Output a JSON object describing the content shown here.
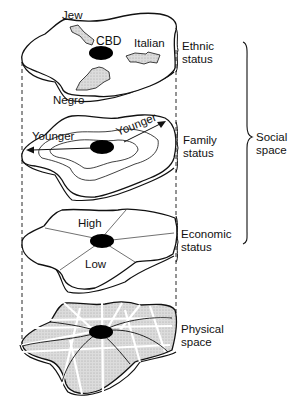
{
  "layers": [
    {
      "id": "ethnic",
      "label_lines": [
        "Ethnic",
        "status"
      ],
      "inner_labels": {
        "jew": "Jew",
        "cbd": "CBD",
        "italian": "Italian",
        "negro": "Negro"
      }
    },
    {
      "id": "family",
      "label_lines": [
        "Family",
        "status"
      ],
      "inner_labels": {
        "younger_left": "Younger",
        "younger_right": "Younger"
      }
    },
    {
      "id": "economic",
      "label_lines": [
        "Economic",
        "status"
      ],
      "inner_labels": {
        "high": "High",
        "low": "Low"
      }
    },
    {
      "id": "physical",
      "label_lines": [
        "Physical",
        "space"
      ],
      "inner_labels": {}
    }
  ],
  "group_brace": {
    "label_lines": [
      "Social",
      "space"
    ],
    "spans_layers": [
      "ethnic",
      "family",
      "economic"
    ]
  },
  "colors": {
    "ink": "#111111",
    "ethnic_area_fill": "#d8d8d8",
    "physical_fill": "#d4d4d4",
    "cbd_fill": "#000000",
    "background": "#ffffff"
  }
}
